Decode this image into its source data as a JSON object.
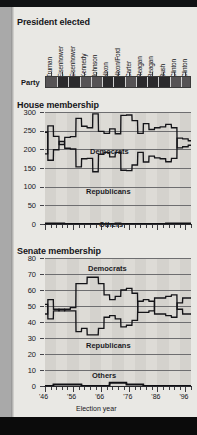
{
  "page": {
    "background_color": "#e9e8e4",
    "frame_color": "#0d0d0d",
    "margin_color": "#a9a9a9"
  },
  "sections": {
    "president": {
      "title": "President elected"
    },
    "house": {
      "title": "House membership"
    },
    "senate": {
      "title": "Senate membership"
    }
  },
  "president_block": {
    "party_row_label": "Party",
    "presidents": [
      {
        "name": "Truman",
        "party": "Democrat"
      },
      {
        "name": "Eisenhower",
        "party": "Republican"
      },
      {
        "name": "Eisenhower",
        "party": "Republican"
      },
      {
        "name": "Kennedy",
        "party": "Democrat"
      },
      {
        "name": "Johnson",
        "party": "Democrat"
      },
      {
        "name": "Nixon",
        "party": "Republican"
      },
      {
        "name": "Nixon/Ford",
        "party": "Republican"
      },
      {
        "name": "Carter",
        "party": "Democrat"
      },
      {
        "name": "Reagan",
        "party": "Republican"
      },
      {
        "name": "Reagan",
        "party": "Republican"
      },
      {
        "name": "Bush",
        "party": "Republican"
      },
      {
        "name": "Clinton",
        "party": "Democrat"
      },
      {
        "name": "Clinton",
        "party": "Democrat"
      }
    ],
    "party_colors": {
      "Democrat": "#565355",
      "Republican": "#2b2a2c"
    }
  },
  "chart_data": [
    {
      "type": "line",
      "title": "House membership",
      "xlabel": "Election year",
      "ylabel": "",
      "ylim": [
        0,
        300
      ],
      "yticks": [
        0,
        50,
        100,
        150,
        200,
        250,
        300
      ],
      "ytick_labels": [
        "0",
        "50",
        "100",
        "150",
        "200",
        "250",
        "300"
      ],
      "xlim": [
        1946,
        1998
      ],
      "xticks": [
        1946,
        1956,
        1966,
        1976,
        1986,
        1996
      ],
      "xtick_labels": [
        "'46",
        "'56",
        "'66",
        "'76",
        "'86",
        "'96"
      ],
      "grid": true,
      "legend": "inline-labels",
      "annotations": [
        "Democrats",
        "Republicans",
        "Others"
      ],
      "x": [
        1946,
        1948,
        1950,
        1952,
        1954,
        1956,
        1958,
        1960,
        1962,
        1964,
        1966,
        1968,
        1970,
        1972,
        1974,
        1976,
        1978,
        1980,
        1982,
        1984,
        1986,
        1988,
        1990,
        1992,
        1994,
        1996,
        1998
      ],
      "series": [
        {
          "name": "Democrats",
          "values": [
            188,
            263,
            235,
            213,
            232,
            234,
            283,
            262,
            258,
            295,
            248,
            243,
            255,
            242,
            291,
            292,
            277,
            243,
            269,
            253,
            258,
            260,
            267,
            258,
            204,
            207,
            211
          ]
        },
        {
          "name": "Republicans",
          "values": [
            246,
            171,
            199,
            221,
            203,
            201,
            153,
            175,
            176,
            140,
            187,
            192,
            180,
            192,
            144,
            143,
            158,
            192,
            166,
            182,
            177,
            175,
            167,
            176,
            230,
            228,
            223
          ]
        },
        {
          "name": "Others",
          "values": [
            1,
            1,
            1,
            1,
            0,
            0,
            0,
            0,
            0,
            0,
            0,
            0,
            0,
            1,
            0,
            0,
            0,
            0,
            0,
            0,
            0,
            0,
            1,
            1,
            1,
            1,
            1
          ]
        }
      ]
    },
    {
      "type": "line",
      "title": "Senate membership",
      "xlabel": "Election year",
      "ylabel": "",
      "ylim": [
        0,
        80
      ],
      "yticks": [
        0,
        10,
        20,
        30,
        40,
        50,
        60,
        70,
        80
      ],
      "ytick_labels": [
        "0",
        "10",
        "20",
        "30",
        "40",
        "50",
        "60",
        "70",
        "80"
      ],
      "xlim": [
        1946,
        1998
      ],
      "xticks": [
        1946,
        1956,
        1966,
        1976,
        1986,
        1996
      ],
      "xtick_labels": [
        "'46",
        "'56",
        "'66",
        "'76",
        "'86",
        "'96"
      ],
      "grid": true,
      "legend": "inline-labels",
      "annotations": [
        "Democrats",
        "Republicans",
        "Others"
      ],
      "x": [
        1946,
        1948,
        1950,
        1952,
        1954,
        1956,
        1958,
        1960,
        1962,
        1964,
        1966,
        1968,
        1970,
        1972,
        1974,
        1976,
        1978,
        1980,
        1982,
        1984,
        1986,
        1988,
        1990,
        1992,
        1994,
        1996,
        1998
      ],
      "series": [
        {
          "name": "Democrats",
          "values": [
            45,
            54,
            48,
            47,
            48,
            49,
            64,
            64,
            68,
            68,
            64,
            57,
            54,
            56,
            60,
            61,
            58,
            46,
            46,
            47,
            55,
            55,
            56,
            57,
            48,
            45,
            45
          ]
        },
        {
          "name": "Republicans",
          "values": [
            51,
            42,
            47,
            48,
            47,
            47,
            34,
            36,
            32,
            32,
            36,
            43,
            44,
            42,
            37,
            38,
            41,
            53,
            54,
            53,
            45,
            45,
            44,
            43,
            52,
            55,
            55
          ]
        },
        {
          "name": "Others",
          "values": [
            0,
            0,
            1,
            1,
            1,
            1,
            1,
            0,
            0,
            0,
            0,
            0,
            2,
            2,
            2,
            1,
            1,
            1,
            0,
            0,
            0,
            0,
            0,
            0,
            0,
            0,
            0
          ]
        }
      ]
    }
  ]
}
